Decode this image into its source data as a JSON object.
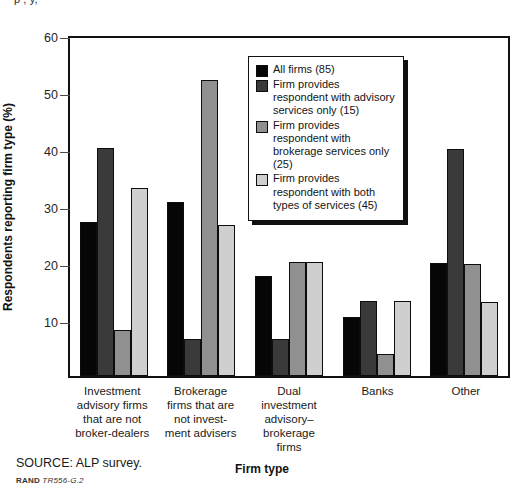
{
  "figure": {
    "title_sliver": "p                 ,   y,",
    "source_note": "SOURCE: ALP survey.",
    "rand_prefix": "RAND",
    "rand_id": "TR556-G.2"
  },
  "chart_data": {
    "type": "bar",
    "title": "",
    "xlabel": "Firm type",
    "ylabel": "Respondents reporting firm type (%)",
    "ylim": [
      0,
      60
    ],
    "yticks": [
      10,
      20,
      30,
      40,
      50,
      60
    ],
    "grid": false,
    "legend_position": "upper-center-right",
    "categories": [
      "Investment advisory firms that are not broker-dealers",
      "Brokerage firms that are not investment advisers",
      "Dual investment advisory–brokerage firms",
      "Banks",
      "Other"
    ],
    "category_labels": [
      "Investment\nadvisory firms\nthat are not\nbroker-dealers",
      "Brokerage\nfirms that are\nnot invest-\nment advisers",
      "Dual\ninvestment\nadvisory–\nbrokerage\nfirms",
      "Banks",
      "Other"
    ],
    "series": [
      {
        "name": "All firms (85)",
        "color": "#060606",
        "values": [
          27.0,
          30.5,
          17.5,
          10.4,
          19.8
        ]
      },
      {
        "name": "Firm provides respondent with advisory services only (15)",
        "color": "#3a3a3a",
        "values": [
          40.0,
          6.5,
          6.5,
          13.2,
          39.8
        ]
      },
      {
        "name": "Firm provides respondent with brokerage services only (25)",
        "color": "#909090",
        "values": [
          8.0,
          52.0,
          20.0,
          3.8,
          19.6
        ]
      },
      {
        "name": "Firm provides respondent with both types of services (45)",
        "color": "#cfcfcf",
        "values": [
          33.0,
          26.5,
          20.0,
          13.2,
          13.0
        ]
      }
    ]
  },
  "legend": {
    "items": [
      {
        "label": "All firms (85)",
        "color": "#060606"
      },
      {
        "label": "Firm provides respondent with advisory services only (15)",
        "color": "#3a3a3a"
      },
      {
        "label": "Firm provides respondent with brokerage services only (25)",
        "color": "#909090"
      },
      {
        "label": "Firm provides respondent with both types of services (45)",
        "color": "#cfcfcf"
      }
    ]
  }
}
